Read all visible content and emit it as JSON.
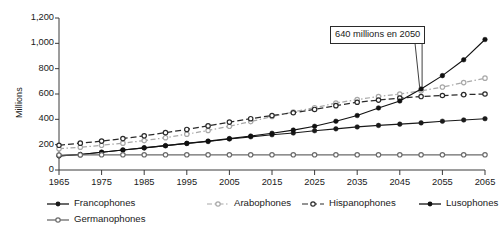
{
  "chart_data": {
    "type": "line",
    "title": "",
    "subtitle": "",
    "xlabel": "",
    "ylabel": "Millions",
    "xlim": [
      1965,
      2065
    ],
    "ylim": [
      0,
      1200
    ],
    "ytick_step": 200,
    "xtick_step": 10,
    "grid": false,
    "legend_position": "bottom",
    "x": [
      1965,
      1970,
      1975,
      1980,
      1985,
      1990,
      1995,
      2000,
      2005,
      2010,
      2015,
      2020,
      2025,
      2030,
      2035,
      2040,
      2045,
      2050,
      2055,
      2060,
      2065
    ],
    "xtick_labels": [
      "1965",
      "1975",
      "1985",
      "1995",
      "2005",
      "2015",
      "2025",
      "2035",
      "2045",
      "2055",
      "2065"
    ],
    "ytick_labels": [
      "0",
      "200",
      "400",
      "600",
      "800",
      "1,000",
      "1,200"
    ],
    "series": [
      {
        "name": "Francophones",
        "color": "#1a1a1a",
        "style": "solid",
        "marker": "filled-circle",
        "values": [
          112,
          122,
          140,
          158,
          175,
          192,
          210,
          225,
          245,
          262,
          278,
          292,
          310,
          325,
          340,
          352,
          362,
          372,
          385,
          395,
          405
        ]
      },
      {
        "name": "Arabophones",
        "color": "#a8a8a8",
        "style": "dash-dot",
        "marker": "open-circle",
        "values": [
          168,
          180,
          195,
          212,
          232,
          255,
          283,
          312,
          345,
          382,
          422,
          458,
          492,
          528,
          556,
          580,
          600,
          625,
          655,
          690,
          725
        ]
      },
      {
        "name": "Hispanophones",
        "color": "#2a2a2a",
        "style": "dashed",
        "marker": "open-circle",
        "values": [
          195,
          212,
          228,
          248,
          270,
          295,
          320,
          348,
          378,
          405,
          430,
          452,
          478,
          508,
          535,
          552,
          568,
          580,
          588,
          595,
          600
        ]
      },
      {
        "name": "Lusophones",
        "color": "#111111",
        "style": "solid",
        "marker": "filled-circle",
        "values": [
          112,
          122,
          140,
          158,
          175,
          192,
          210,
          228,
          248,
          268,
          290,
          315,
          345,
          385,
          430,
          490,
          545,
          640,
          745,
          870,
          1030
        ]
      },
      {
        "name": "Germanophones",
        "color": "#6b6b6b",
        "style": "solid",
        "marker": "open-circle",
        "values": [
          118,
          119,
          120,
          120,
          120,
          120,
          120,
          120,
          120,
          120,
          120,
          120,
          120,
          120,
          120,
          120,
          120,
          120,
          120,
          120,
          120
        ]
      }
    ],
    "annotations": [
      {
        "text": "640 millions en 2050",
        "x": 2050,
        "y": 640
      }
    ]
  },
  "legend": {
    "row1": [
      {
        "label": "Francophones"
      },
      {
        "label": "Arabophones"
      },
      {
        "label": "Hispanophones"
      },
      {
        "label": "Lusophones"
      }
    ],
    "row2": [
      {
        "label": "Germanophones"
      }
    ]
  },
  "axis": {
    "y_title": "Millions"
  }
}
